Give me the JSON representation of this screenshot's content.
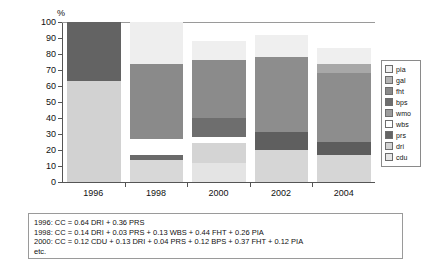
{
  "chart_data": {
    "type": "bar",
    "stacked": true,
    "title": "",
    "subtitle": "",
    "xlabel": "",
    "ylabel": "%",
    "ylim": [
      0,
      100
    ],
    "ytick_labels": [
      "100",
      "90",
      "80",
      "70",
      "60",
      "50",
      "40",
      "30",
      "20",
      "10",
      "0"
    ],
    "ytick_values": [
      100,
      90,
      80,
      70,
      60,
      50,
      40,
      30,
      20,
      10,
      0
    ],
    "grid": false,
    "legend_position": "right",
    "categories": [
      "1996",
      "1998",
      "2000",
      "2002",
      "2004"
    ],
    "series": [
      {
        "name": "pia",
        "color": "#efefef",
        "values": [
          0,
          26,
          12,
          14,
          10
        ]
      },
      {
        "name": "gal",
        "color": "#b4b4b4",
        "values": [
          0,
          0,
          0,
          0,
          0
        ]
      },
      {
        "name": "fht",
        "color": "#858585",
        "values": [
          0,
          47,
          37,
          47,
          43
        ]
      },
      {
        "name": "bps",
        "color": "#6e6e6e",
        "values": [
          0,
          0,
          12,
          0,
          0
        ]
      },
      {
        "name": "wmo",
        "color": "#9a9a9a",
        "values": [
          0,
          0,
          0,
          11,
          8
        ]
      },
      {
        "name": "wbs",
        "color": "#ffffff",
        "values": [
          0,
          10,
          4,
          0,
          0
        ]
      },
      {
        "name": "prs",
        "color": "#6a6a6a",
        "values": [
          37,
          3,
          0,
          0,
          0
        ]
      },
      {
        "name": "dri",
        "color": "#c9c9c9",
        "values": [
          63,
          14,
          13,
          20,
          17
        ]
      },
      {
        "name": "cdu",
        "color": "#e0e0e0",
        "values": [
          0,
          0,
          12,
          0,
          6
        ]
      }
    ],
    "bar_totals": [
      100,
      100,
      88,
      92,
      84
    ],
    "stacks": [
      {
        "category": "1996",
        "total": 100,
        "segments": [
          {
            "key": "dri",
            "label": "dri",
            "value": 63,
            "color": "#d2d2d2"
          },
          {
            "key": "prs",
            "label": "prs",
            "value": 37,
            "color": "#636363"
          }
        ]
      },
      {
        "category": "1998",
        "total": 100,
        "segments": [
          {
            "key": "dri",
            "label": "dri",
            "value": 14,
            "color": "#d8d8d8"
          },
          {
            "key": "prs",
            "label": "prs",
            "value": 3,
            "color": "#6a6a6a"
          },
          {
            "key": "wbs",
            "label": "wbs",
            "value": 10,
            "color": "#ffffff"
          },
          {
            "key": "fht",
            "label": "fht",
            "value": 47,
            "color": "#8a8a8a"
          },
          {
            "key": "pia",
            "label": "pia",
            "value": 26,
            "color": "#eeeeee"
          }
        ]
      },
      {
        "category": "2000",
        "total": 88,
        "segments": [
          {
            "key": "cdu",
            "label": "cdu",
            "value": 12,
            "color": "#e4e4e4"
          },
          {
            "key": "dri",
            "label": "dri",
            "value": 13,
            "color": "#d4d4d4"
          },
          {
            "key": "prs",
            "label": "prs",
            "value": 4,
            "color": "#ffffff"
          },
          {
            "key": "bps",
            "label": "bps",
            "value": 12,
            "color": "#6e6e6e"
          },
          {
            "key": "fht",
            "label": "fht",
            "value": 37,
            "color": "#8b8b8b"
          },
          {
            "key": "pia",
            "label": "pia",
            "value": 12,
            "color": "#efefef"
          }
        ]
      },
      {
        "category": "2002",
        "total": 92,
        "segments": [
          {
            "key": "dri",
            "label": "dri",
            "value": 20,
            "color": "#d6d6d6"
          },
          {
            "key": "prs",
            "label": "prs",
            "value": 11,
            "color": "#5f5f5f"
          },
          {
            "key": "wmo",
            "label": "wmo",
            "value": 47,
            "color": "#8d8d8d"
          },
          {
            "key": "pia",
            "label": "pia",
            "value": 14,
            "color": "#efefef"
          }
        ]
      },
      {
        "category": "2004",
        "total": 84,
        "segments": [
          {
            "key": "dri",
            "label": "dri",
            "value": 17,
            "color": "#d6d6d6"
          },
          {
            "key": "prs",
            "label": "prs",
            "value": 8,
            "color": "#5d5d5d"
          },
          {
            "key": "fht",
            "label": "fht",
            "value": 43,
            "color": "#8d8d8d"
          },
          {
            "key": "wmo",
            "label": "wmo",
            "value": 6,
            "color": "#a8a8a8"
          },
          {
            "key": "pia",
            "label": "pia",
            "value": 10,
            "color": "#efefef"
          }
        ]
      }
    ]
  },
  "legend": {
    "items": [
      {
        "label": "pia",
        "color": "#efefef"
      },
      {
        "label": "gal",
        "color": "#b4b4b4"
      },
      {
        "label": "fht",
        "color": "#8a8a8a"
      },
      {
        "label": "bps",
        "color": "#6e6e6e"
      },
      {
        "label": "wmo",
        "color": "#9c9c9c"
      },
      {
        "label": "wbs",
        "color": "#ffffff"
      },
      {
        "label": "prs",
        "color": "#646464"
      },
      {
        "label": "dri",
        "color": "#d2d2d2"
      },
      {
        "label": "cdu",
        "color": "#e6e6e6"
      }
    ]
  },
  "caption": {
    "lines": [
      "1996: CC = 0.64 DRI + 0.36 PRS",
      "1998: CC = 0.14 DRI + 0.03 PRS + 0.13 WBS + 0.44 FHT + 0.26 PIA",
      "2000: CC = 0.12 CDU + 0.13 DRI + 0.04 PRS + 0.12 BPS + 0.37 FHT + 0.12 PIA",
      "etc."
    ]
  }
}
